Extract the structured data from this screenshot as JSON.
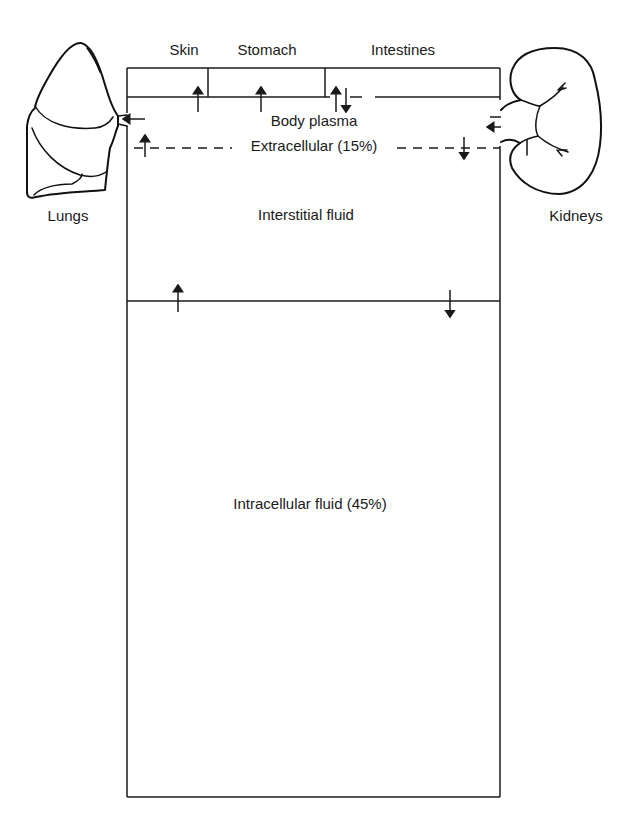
{
  "diagram": {
    "top_compartments": {
      "skin": "Skin",
      "stomach": "Stomach",
      "intestines": "Intestines"
    },
    "plasma": "Body plasma",
    "extracellular": "Extracellular (15%)",
    "interstitial": "Interstitial fluid",
    "intracellular": "Intracellular fluid (45%)",
    "organs": {
      "lungs": "Lungs",
      "kidneys": "Kidneys"
    },
    "colors": {
      "stroke": "#1a1a1a",
      "background": "#ffffff"
    }
  }
}
